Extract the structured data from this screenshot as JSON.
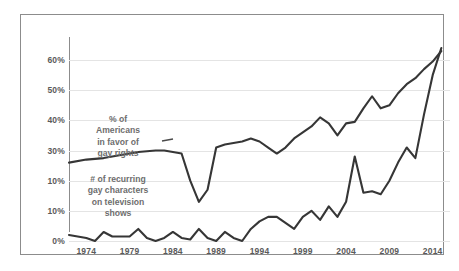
{
  "chart_data": {
    "type": "line",
    "title": "",
    "subtitle": "",
    "xlabel": "",
    "ylabel": "",
    "grid": true,
    "legend_position": "inline-annotations",
    "xlim": [
      1972,
      2016
    ],
    "ylim": [
      0,
      65
    ],
    "xticks": [
      "1974",
      "1979",
      "1984",
      "1989",
      "1994",
      "1999",
      "2004",
      "2009",
      "2014"
    ],
    "xtick_values": [
      1974,
      1979,
      1984,
      1989,
      1994,
      1999,
      2004,
      2009,
      2014
    ],
    "yticks": [
      "60%",
      "50%",
      "40%",
      "30%",
      "10%",
      "10%",
      "0%"
    ],
    "ytick_values": [
      60,
      50,
      40,
      30,
      20,
      10,
      0
    ],
    "series": [
      {
        "name": "% of Americans in favor of gay rights",
        "annotation": "% of\nAmericans\nin favor of\ngay rights",
        "color": "#363636",
        "x": [
          1972,
          1974,
          1976,
          1977,
          1978,
          1980,
          1982,
          1983,
          1984,
          1985,
          1986,
          1987,
          1988,
          1989,
          1990,
          1991,
          1992,
          1993,
          1994,
          1995,
          1996,
          1997,
          1998,
          1999,
          2000,
          2001,
          2002,
          2003,
          2004,
          2005,
          2006,
          2007,
          2008,
          2009,
          2010,
          2011,
          2012,
          2013,
          2014,
          2015
        ],
        "values": [
          26,
          27,
          27.5,
          28,
          28.5,
          29.5,
          30,
          30,
          29.5,
          29,
          20,
          13,
          17,
          31,
          32,
          32.5,
          33,
          34,
          33,
          31,
          29,
          31,
          34,
          36,
          38,
          41,
          39,
          35,
          39,
          39.5,
          44,
          48,
          44,
          45,
          49,
          52,
          54,
          57,
          59.5,
          63
        ]
      },
      {
        "name": "# of recurring gay characters on television shows",
        "annotation": "# of recurring\ngay characters\non television\nshows",
        "color": "#363636",
        "x": [
          1972,
          1974,
          1975,
          1976,
          1977,
          1978,
          1979,
          1980,
          1981,
          1982,
          1983,
          1984,
          1985,
          1986,
          1987,
          1988,
          1989,
          1990,
          1991,
          1992,
          1993,
          1994,
          1995,
          1996,
          1997,
          1998,
          1999,
          2000,
          2001,
          2002,
          2003,
          2004,
          2005,
          2006,
          2007,
          2008,
          2009,
          2010,
          2011,
          2012,
          2013,
          2014,
          2015
        ],
        "values": [
          2,
          1,
          0,
          3,
          1.5,
          1.5,
          1.5,
          4,
          1,
          0,
          1,
          3,
          1,
          0.5,
          4,
          1,
          0,
          3,
          1,
          0,
          4,
          6.5,
          8,
          8,
          6,
          4,
          8,
          10,
          7,
          11.5,
          8,
          13,
          28,
          16,
          16.5,
          15.5,
          20,
          26,
          31,
          27.5,
          42,
          55,
          64
        ]
      }
    ]
  }
}
